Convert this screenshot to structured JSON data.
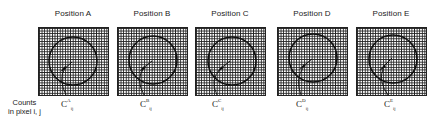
{
  "figure": {
    "side_label": {
      "line1": "Counts",
      "line2": "in pixel i, j"
    },
    "panels": [
      {
        "title": "Position A",
        "symbol": "C",
        "sup": "A",
        "sub": "ij"
      },
      {
        "title": "Position B",
        "symbol": "C",
        "sup": "B",
        "sub": "ij"
      },
      {
        "title": "Position C",
        "symbol": "C",
        "sup": "C",
        "sub": "ij"
      },
      {
        "title": "Position D",
        "symbol": "C",
        "sup": "D",
        "sub": "ij"
      },
      {
        "title": "Position E",
        "symbol": "C",
        "sup": "E",
        "sub": "ij"
      }
    ]
  }
}
